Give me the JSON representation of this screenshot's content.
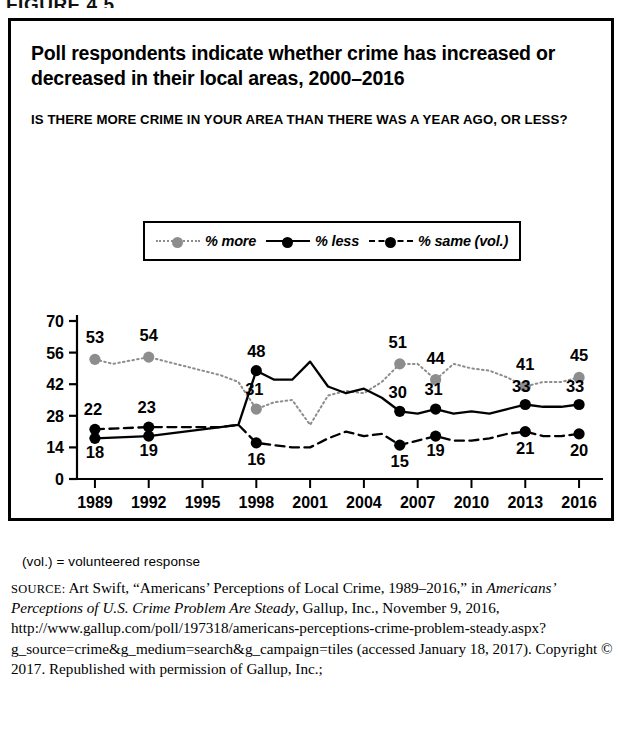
{
  "figure_number": "FIGURE 4.5",
  "title": "Poll respondents indicate whether crime has increased or decreased in their local areas, 2000–2016",
  "subtitle": "IS THERE MORE CRIME IN YOUR AREA THAN THERE WAS A YEAR AGO, OR LESS?",
  "legend": {
    "items": [
      {
        "label": "% more",
        "key": "more-series-key",
        "color": "#8d8d8d",
        "style": "dotted"
      },
      {
        "label": "% less",
        "key": "less-series-key",
        "color": "#000000",
        "style": "solid"
      },
      {
        "label": "% same (vol.)",
        "key": "same-series-key",
        "color": "#000000",
        "style": "dashed"
      }
    ]
  },
  "notes": {
    "vol": "(vol.) = volunteered response"
  },
  "source": {
    "label": "SOURCE:",
    "text_before_italic": " Art Swift, “Americans’ Perceptions of Local Crime, 1989–2016,” in ",
    "italic_title": "Americans’ Perceptions of U.S. Crime Problem Are Steady",
    "text_after_italic": ", Gallup, Inc., November 9, 2016, http://www.gallup.com/poll/197318/americans-perceptions-crime-problem-steady.aspx?g_source=crime&g_medium=search&g_campaign=tiles (accessed January 18, 2017). Copyright © 2017. Republished with permission of Gallup, Inc.;"
  },
  "chart_data": {
    "type": "line",
    "title": "Poll respondents indicate whether crime has increased or decreased in their local areas, 2000–2016",
    "xlabel": "",
    "ylabel": "",
    "ylim": [
      0,
      70
    ],
    "yticks": [
      0,
      14,
      28,
      42,
      56,
      70
    ],
    "xticks": [
      "1989",
      "1992",
      "1995",
      "1998",
      "2001",
      "2004",
      "2007",
      "2010",
      "2013",
      "2016"
    ],
    "xlim": [
      1988,
      2017
    ],
    "grid": false,
    "legend_position": "above-plot",
    "series": [
      {
        "name": "% more",
        "color": "#8d8d8d",
        "style": "dotted",
        "points": [
          {
            "x": 1989,
            "y": 53,
            "label": "53"
          },
          {
            "x": 1990,
            "y": 51,
            "label": null
          },
          {
            "x": 1992,
            "y": 54,
            "label": "54"
          },
          {
            "x": 1993,
            "y": 52,
            "label": null
          },
          {
            "x": 1996,
            "y": 46,
            "label": null
          },
          {
            "x": 1997,
            "y": 43,
            "label": null
          },
          {
            "x": 1998,
            "y": 31,
            "label": "31"
          },
          {
            "x": 1999,
            "y": 34,
            "label": null
          },
          {
            "x": 2000,
            "y": 35,
            "label": null
          },
          {
            "x": 2001,
            "y": 24,
            "label": null
          },
          {
            "x": 2002,
            "y": 37,
            "label": null
          },
          {
            "x": 2003,
            "y": 39,
            "label": null
          },
          {
            "x": 2004,
            "y": 38,
            "label": null
          },
          {
            "x": 2005,
            "y": 43,
            "label": null
          },
          {
            "x": 2006,
            "y": 51,
            "label": "51"
          },
          {
            "x": 2007,
            "y": 51,
            "label": null
          },
          {
            "x": 2008,
            "y": 44,
            "label": "44"
          },
          {
            "x": 2009,
            "y": 51,
            "label": null
          },
          {
            "x": 2010,
            "y": 49,
            "label": null
          },
          {
            "x": 2011,
            "y": 48,
            "label": null
          },
          {
            "x": 2012,
            "y": 45,
            "label": null
          },
          {
            "x": 2013,
            "y": 41,
            "label": "41"
          },
          {
            "x": 2014,
            "y": 43,
            "label": null
          },
          {
            "x": 2015,
            "y": 43,
            "label": null
          },
          {
            "x": 2016,
            "y": 45,
            "label": "45"
          }
        ]
      },
      {
        "name": "% less",
        "color": "#000000",
        "style": "solid",
        "points": [
          {
            "x": 1989,
            "y": 18,
            "label": "18"
          },
          {
            "x": 1992,
            "y": 19,
            "label": "19"
          },
          {
            "x": 1996,
            "y": 23,
            "label": null
          },
          {
            "x": 1997,
            "y": 24,
            "label": null
          },
          {
            "x": 1998,
            "y": 48,
            "label": "48"
          },
          {
            "x": 1999,
            "y": 44,
            "label": null
          },
          {
            "x": 2000,
            "y": 44,
            "label": null
          },
          {
            "x": 2001,
            "y": 52,
            "label": null
          },
          {
            "x": 2002,
            "y": 41,
            "label": null
          },
          {
            "x": 2003,
            "y": 38,
            "label": null
          },
          {
            "x": 2004,
            "y": 40,
            "label": null
          },
          {
            "x": 2005,
            "y": 36,
            "label": null
          },
          {
            "x": 2006,
            "y": 30,
            "label": "30"
          },
          {
            "x": 2007,
            "y": 29,
            "label": null
          },
          {
            "x": 2008,
            "y": 31,
            "label": "31"
          },
          {
            "x": 2009,
            "y": 29,
            "label": null
          },
          {
            "x": 2010,
            "y": 30,
            "label": null
          },
          {
            "x": 2011,
            "y": 29,
            "label": null
          },
          {
            "x": 2012,
            "y": 31,
            "label": null
          },
          {
            "x": 2013,
            "y": 33,
            "label": "33"
          },
          {
            "x": 2014,
            "y": 32,
            "label": null
          },
          {
            "x": 2015,
            "y": 32,
            "label": null
          },
          {
            "x": 2016,
            "y": 33,
            "label": "33"
          }
        ]
      },
      {
        "name": "% same (vol.)",
        "color": "#000000",
        "style": "dashed",
        "points": [
          {
            "x": 1989,
            "y": 22,
            "label": "22"
          },
          {
            "x": 1992,
            "y": 23,
            "label": "23"
          },
          {
            "x": 1996,
            "y": 23,
            "label": null
          },
          {
            "x": 1997,
            "y": 24,
            "label": null
          },
          {
            "x": 1998,
            "y": 16,
            "label": "16"
          },
          {
            "x": 1999,
            "y": 15,
            "label": null
          },
          {
            "x": 2000,
            "y": 14,
            "label": null
          },
          {
            "x": 2001,
            "y": 14,
            "label": null
          },
          {
            "x": 2002,
            "y": 18,
            "label": null
          },
          {
            "x": 2003,
            "y": 21,
            "label": null
          },
          {
            "x": 2004,
            "y": 19,
            "label": null
          },
          {
            "x": 2005,
            "y": 20,
            "label": null
          },
          {
            "x": 2006,
            "y": 15,
            "label": "15"
          },
          {
            "x": 2007,
            "y": 17,
            "label": null
          },
          {
            "x": 2008,
            "y": 19,
            "label": "19"
          },
          {
            "x": 2009,
            "y": 17,
            "label": null
          },
          {
            "x": 2010,
            "y": 17,
            "label": null
          },
          {
            "x": 2011,
            "y": 18,
            "label": null
          },
          {
            "x": 2012,
            "y": 20,
            "label": null
          },
          {
            "x": 2013,
            "y": 21,
            "label": "21"
          },
          {
            "x": 2014,
            "y": 19,
            "label": null
          },
          {
            "x": 2015,
            "y": 19,
            "label": null
          },
          {
            "x": 2016,
            "y": 20,
            "label": "20"
          }
        ]
      }
    ],
    "label_offsets": {
      "53": [
        0,
        -16
      ],
      "54": [
        0,
        -16
      ],
      "31": [
        -2,
        -14
      ],
      "51": [
        -2,
        -16
      ],
      "44": [
        0,
        -16
      ],
      "41": [
        0,
        -16
      ],
      "45": [
        0,
        -16
      ],
      "18": [
        0,
        20
      ],
      "19": [
        0,
        20
      ],
      "48": [
        0,
        -14
      ],
      "30": [
        -2,
        -13
      ],
      "33": [
        -4,
        -13
      ],
      "22": [
        -2,
        -14
      ],
      "23": [
        -2,
        -14
      ],
      "16": [
        0,
        22
      ],
      "15": [
        0,
        22
      ],
      "21": [
        0,
        22
      ],
      "20": [
        0,
        22
      ]
    }
  }
}
